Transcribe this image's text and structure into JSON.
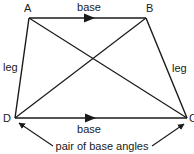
{
  "figure": {
    "type": "isosceles-trapezoid",
    "vertices": {
      "A": {
        "label": "A",
        "x": 29,
        "y": 18
      },
      "B": {
        "label": "B",
        "x": 146,
        "y": 18
      },
      "C": {
        "label": "C",
        "x": 187,
        "y": 118
      },
      "D": {
        "label": "D",
        "x": 15,
        "y": 118
      }
    },
    "labels": {
      "top_base": "base",
      "bottom_base": "base",
      "left_leg": "leg",
      "right_leg": "leg",
      "annotation": "pair of base angles"
    },
    "stroke_color": "#1a1a1a",
    "background": "#ffffff"
  }
}
